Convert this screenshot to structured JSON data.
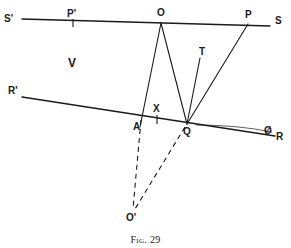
{
  "figure": {
    "caption_prefix": "Fig.",
    "caption_number": "29",
    "background_color": "#ffffff",
    "ink_color": "#1a1a1a",
    "width": 291,
    "height": 248
  },
  "labels": {
    "s_prime": "S'",
    "p_prime": "P'",
    "o": "O",
    "p": "P",
    "s": "S",
    "t": "T",
    "v": "V",
    "r_prime": "R'",
    "a": "A",
    "x": "X",
    "q": "Q",
    "phi": "Ø",
    "r": "R",
    "o_prime": "O'"
  },
  "geometry": {
    "points": {
      "S_prime_end": [
        22,
        19
      ],
      "P_prime_tick": [
        73,
        20
      ],
      "O": [
        161,
        23
      ],
      "P": [
        248,
        26
      ],
      "S_end": [
        270,
        26
      ],
      "T_end": [
        200,
        58
      ],
      "R_prime_end": [
        22,
        97
      ],
      "A": [
        141,
        118
      ],
      "X_tick": [
        157,
        120
      ],
      "Q": [
        187,
        123
      ],
      "R_end": [
        275,
        136
      ],
      "O_prime": [
        133,
        212
      ]
    },
    "solid_lines": [
      {
        "name": "line-SS-prime",
        "from": [
          22,
          19
        ],
        "to": [
          270,
          26
        ]
      },
      {
        "name": "line-RR-prime",
        "from": [
          22,
          97
        ],
        "to": [
          275,
          136
        ]
      },
      {
        "name": "line-O-to-A",
        "from": [
          161,
          23
        ],
        "to": [
          140,
          126
        ]
      },
      {
        "name": "line-O-to-Q",
        "from": [
          161,
          23
        ],
        "to": [
          187,
          123
        ]
      },
      {
        "name": "line-Q-to-T",
        "from": [
          187,
          123
        ],
        "to": [
          200,
          58
        ]
      },
      {
        "name": "line-Q-to-P",
        "from": [
          187,
          123
        ],
        "to": [
          248,
          24
        ]
      }
    ],
    "dashed_lines": [
      {
        "name": "line-A-to-O-prime",
        "from": [
          141,
          121
        ],
        "to": [
          133,
          209
        ]
      },
      {
        "name": "line-Q-to-O-prime",
        "from": [
          185,
          126
        ],
        "to": [
          135,
          209
        ]
      }
    ],
    "tick_marks": [
      {
        "name": "tick-P-prime",
        "x": 73,
        "y_top": 19,
        "y_bottom": 26
      },
      {
        "name": "tick-X",
        "x": 157,
        "y_top": 116,
        "y_bottom": 123
      }
    ],
    "arc": {
      "name": "angle-arc-Q-R",
      "from": [
        197,
        125
      ],
      "to": [
        272,
        131
      ]
    }
  }
}
